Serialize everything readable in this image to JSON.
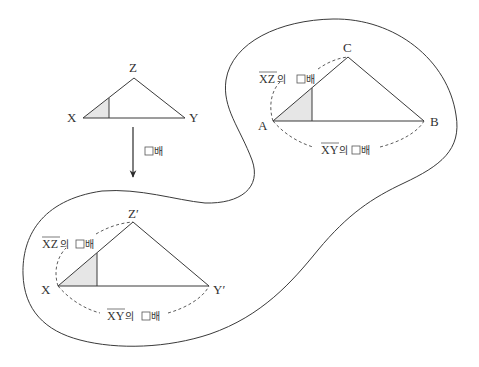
{
  "diagram": {
    "type": "similar-triangle-scaling",
    "original_triangle": {
      "vertices": {
        "x": "X",
        "y": "Y",
        "z": "Z"
      }
    },
    "scaling": {
      "arrow_label_box": "□",
      "arrow_label_suffix": "배"
    },
    "region_target_triangle": {
      "vertices": {
        "a": "A",
        "b": "B",
        "c": "C"
      },
      "side_label_xz": {
        "segment": "XZ",
        "text": "의 ",
        "box": "□",
        "suffix": "배"
      },
      "side_label_xy": {
        "segment": "XY",
        "text": "의 ",
        "box": "□",
        "suffix": "배"
      }
    },
    "scaled_triangle": {
      "vertices": {
        "x": "X",
        "y": "Y′",
        "z": "Z′"
      },
      "side_label_xz": {
        "segment": "XZ",
        "text": "의 ",
        "box": "□",
        "suffix": "배"
      },
      "side_label_xy": {
        "segment": "XY",
        "text": "의 ",
        "box": "□",
        "suffix": "배"
      }
    },
    "colors": {
      "stroke": "#3a3a3a",
      "shade": "#e6e6e6",
      "background": "#ffffff"
    }
  }
}
